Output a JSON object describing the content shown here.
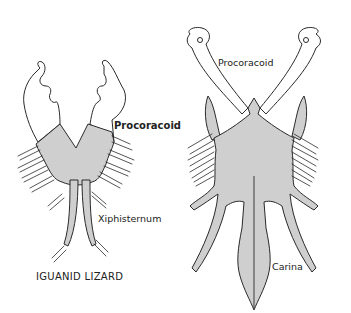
{
  "figure": {
    "left_specimen": {
      "caption": "IGUANID LIZARD",
      "labels": {
        "procoracoid": "Procoracoid",
        "xiphisternum": "Xiphisternum"
      }
    },
    "right_specimen": {
      "labels": {
        "procoracoid": "Procoracoid",
        "carina": "Carina"
      }
    }
  },
  "colors": {
    "bone_fill": "#cfcfcf",
    "outline": "#2a2a2a",
    "background": "#ffffff"
  }
}
